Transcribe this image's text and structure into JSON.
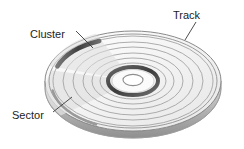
{
  "figure": {
    "background_color": "#ffffff"
  },
  "labels": {
    "track": "Track",
    "cluster": "Cluster",
    "sector": "Sector"
  },
  "colors": {
    "text": "#1c1c1c",
    "leader_line": "#3a3a3a",
    "platter_fill": "#f7f7f7",
    "platter_edge": "#8a8a8a",
    "track_line": "#9b9b9b",
    "cluster_band": "#4a4a4a",
    "hub_ring": "#4a4a4a",
    "hub_fill": "#ffffff",
    "rim_shadow": "#c9c9c9"
  },
  "diagram": {
    "type": "isometric-disk",
    "center": {
      "x": 133,
      "y": 81
    },
    "outer_radius_x": 88,
    "outer_radius_y": 50,
    "thickness": 7,
    "track_count": 7,
    "tracks": [
      {
        "index": 1,
        "rx": 80,
        "ry": 45
      },
      {
        "index": 2,
        "rx": 70,
        "ry": 39
      },
      {
        "index": 3,
        "rx": 60,
        "ry": 34
      },
      {
        "index": 4,
        "rx": 50,
        "ry": 28
      },
      {
        "index": 5,
        "rx": 41,
        "ry": 23
      },
      {
        "index": 6,
        "rx": 33,
        "ry": 18
      },
      {
        "index": 7,
        "rx": 25,
        "ry": 14
      }
    ],
    "hub": {
      "rx": 15,
      "ry": 8
    },
    "cluster_band": {
      "rx": 76,
      "ry": 43,
      "start_angle": 182,
      "end_angle": 252
    },
    "sector_band": {
      "rx": 84,
      "ry": 47,
      "start_angle": 150,
      "end_angle": 196
    }
  },
  "leaders": {
    "track": {
      "x1": 196,
      "y1": 22,
      "x2": 185,
      "y2": 40
    },
    "cluster": {
      "x1": 76,
      "y1": 31,
      "x2": 93,
      "y2": 48
    },
    "sector": {
      "x1": 53,
      "y1": 112,
      "x2": 72,
      "y2": 97
    }
  }
}
